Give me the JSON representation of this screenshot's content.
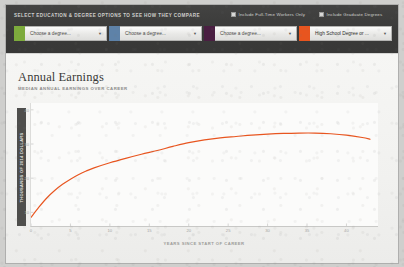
{
  "toolbar": {
    "instruction": "SELECT EDUCATION & DEGREE OPTIONS TO SEE HOW THEY COMPARE",
    "checkboxes": [
      {
        "name": "include-full-time-workers-only",
        "label": "Include Full-Time Workers Only",
        "checked": false
      },
      {
        "name": "include-graduate-degrees",
        "label": "Include Graduate Degrees",
        "checked": false
      }
    ],
    "dropdowns": [
      {
        "name": "degree-select-1",
        "value": "Choose a degree...",
        "placeholder": "Choose a degree...",
        "swatch": "#7DAB3C",
        "chosen": false,
        "caret": "▼"
      },
      {
        "name": "degree-select-2",
        "value": "Choose a degree...",
        "placeholder": "Choose a degree...",
        "swatch": "#5E82A8",
        "chosen": false,
        "caret": "▼"
      },
      {
        "name": "degree-select-3",
        "value": "Choose a degree...",
        "placeholder": "Choose a degree...",
        "swatch": "#4A1F42",
        "chosen": false,
        "caret": "▼"
      },
      {
        "name": "degree-select-4",
        "value": "High School Degree or ...",
        "placeholder": "Choose a degree...",
        "swatch": "#E8551F",
        "chosen": true,
        "caret": "▼"
      }
    ]
  },
  "card": {
    "title": "Annual Earnings",
    "subtitle": "MEDIAN ANNUAL EARNINGS OVER CAREER"
  },
  "chart_data": {
    "type": "line",
    "title": "Annual Earnings",
    "subtitle": "MEDIAN ANNUAL EARNINGS OVER CAREER",
    "xlabel": "YEARS SINCE START OF CAREER",
    "ylabel": "THOUSANDS OF 2014 DOLLARS",
    "xlim": [
      0,
      44
    ],
    "ylim": [
      6,
      42
    ],
    "grid": false,
    "legend_position": "none",
    "xticks": [
      0,
      5,
      10,
      15,
      20,
      25,
      30,
      35,
      40
    ],
    "xtick_labels": [
      "0",
      "5",
      "10",
      "15",
      "20",
      "25",
      "30",
      "35",
      "40"
    ],
    "yticks": [
      10,
      20,
      30,
      40
    ],
    "ytick_labels": [
      "10",
      "20",
      "30",
      "40"
    ],
    "series": [
      {
        "name": "High School Degree or ...",
        "color": "#E8551F",
        "x": [
          0,
          1,
          2,
          3,
          4,
          5,
          6,
          7,
          8,
          10,
          12,
          14,
          16,
          18,
          20,
          22,
          24,
          26,
          28,
          30,
          32,
          34,
          36,
          38,
          40,
          42,
          43
        ],
        "values": [
          8.5,
          11.5,
          14.2,
          16.4,
          18.2,
          19.7,
          21.0,
          22.1,
          23.0,
          24.5,
          25.8,
          27.0,
          28.1,
          29.3,
          30.4,
          31.2,
          31.8,
          32.2,
          32.6,
          32.9,
          33.1,
          33.2,
          33.2,
          33.0,
          32.6,
          31.9,
          31.4
        ]
      }
    ]
  }
}
